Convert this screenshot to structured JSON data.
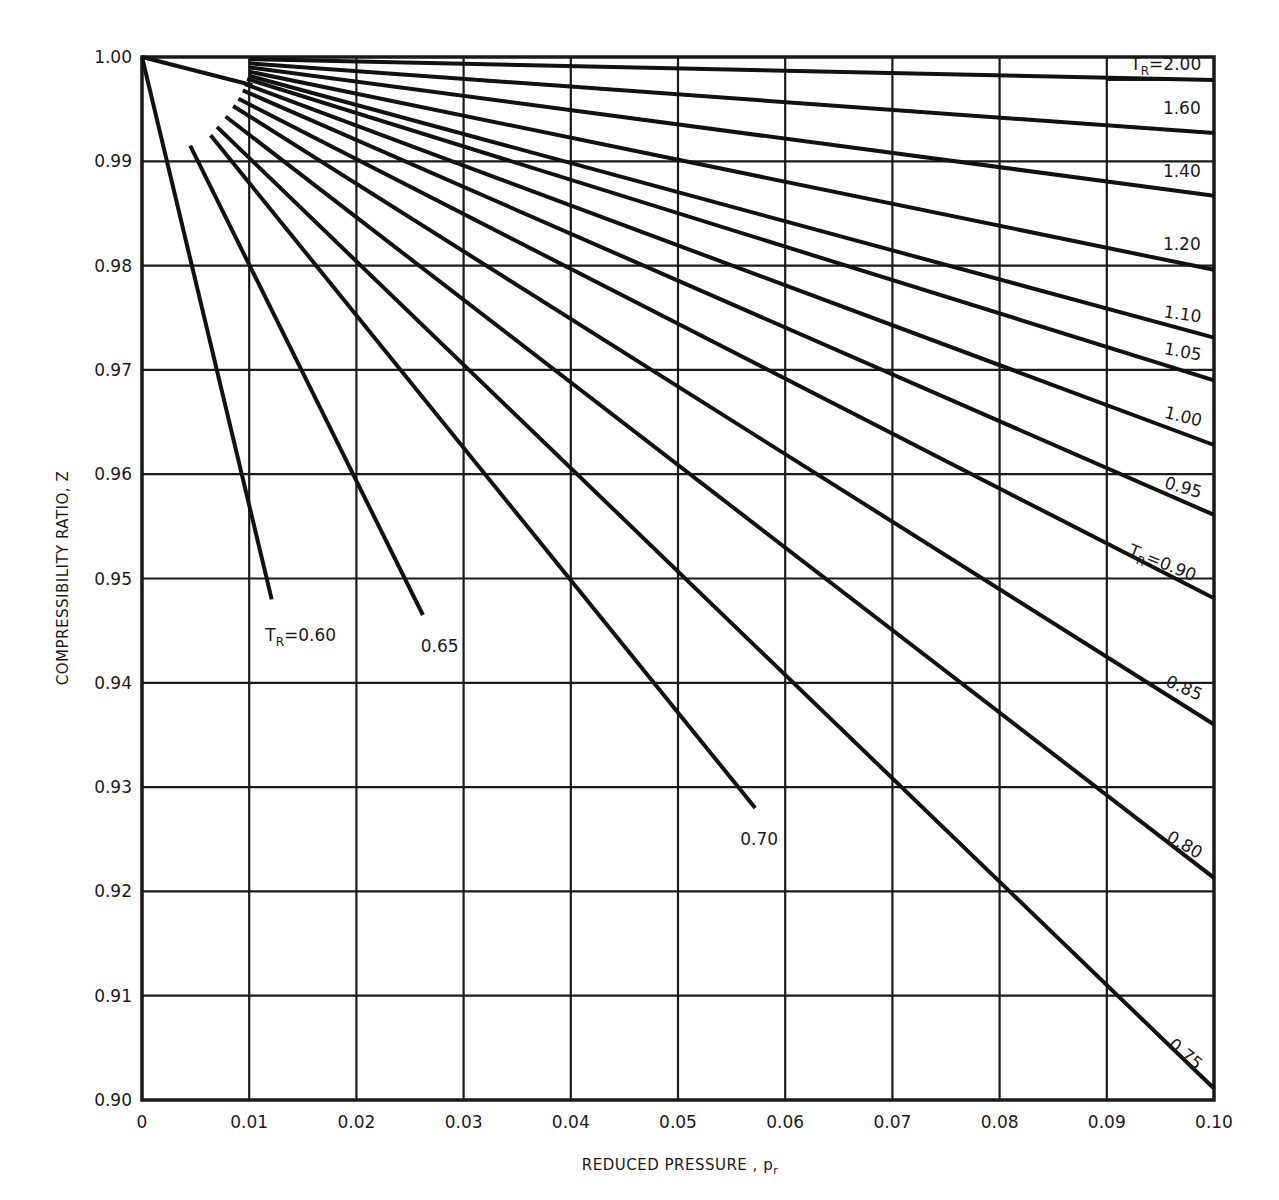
{
  "chart_data": {
    "type": "line",
    "title": "",
    "xlabel": "REDUCED PRESSURE , p",
    "xlabel_sub": "r",
    "ylabel": "COMPRESSIBILITY RATIO, Z",
    "xlim": [
      0,
      0.1
    ],
    "ylim": [
      0.9,
      1.0
    ],
    "grid": true,
    "x_ticks": [
      "0",
      "0.01",
      "0.02",
      "0.03",
      "0.04",
      "0.05",
      "0.06",
      "0.07",
      "0.08",
      "0.09",
      "0.10"
    ],
    "y_ticks": [
      "1.00",
      "0.99",
      "0.98",
      "0.97",
      "0.96",
      "0.95",
      "0.94",
      "0.93",
      "0.92",
      "0.91",
      "0.90"
    ],
    "series": [
      {
        "name": "T_R = 2.00",
        "label": "2.00",
        "prefix": "TR",
        "x": [
          0.01,
          0.1
        ],
        "y": [
          0.9998,
          0.9978
        ]
      },
      {
        "name": "T_R = 1.60",
        "label": "1.60",
        "x": [
          0.01,
          0.1
        ],
        "y": [
          0.9994,
          0.9927
        ]
      },
      {
        "name": "T_R = 1.40",
        "label": "1.40",
        "x": [
          0.01,
          0.1
        ],
        "y": [
          0.999,
          0.9867
        ]
      },
      {
        "name": "T_R = 1.20",
        "label": "1.20",
        "x": [
          0.01,
          0.1
        ],
        "y": [
          0.9986,
          0.9796
        ]
      },
      {
        "name": "T_R = 1.10",
        "label": "1.10",
        "x": [
          0.01,
          0.1
        ],
        "y": [
          0.9982,
          0.9731
        ]
      },
      {
        "name": "T_R = 1.05",
        "label": "1.05",
        "x": [
          0.0098,
          0.1
        ],
        "y": [
          0.9979,
          0.969
        ]
      },
      {
        "name": "T_R = 1.00",
        "label": "1.00",
        "x": [
          0.0096,
          0.1
        ],
        "y": [
          0.9974,
          0.9628
        ]
      },
      {
        "name": "T_R = 0.95",
        "label": "0.95",
        "x": [
          0.0094,
          0.1
        ],
        "y": [
          0.9968,
          0.9561
        ]
      },
      {
        "name": "T_R = 0.90",
        "label": "0.90",
        "prefix": "TR",
        "x": [
          0.009,
          0.1
        ],
        "y": [
          0.996,
          0.9481
        ]
      },
      {
        "name": "T_R = 0.85",
        "label": "0.85",
        "x": [
          0.0085,
          0.1
        ],
        "y": [
          0.9953,
          0.936
        ]
      },
      {
        "name": "T_R = 0.80",
        "label": "0.80",
        "x": [
          0.0078,
          0.1
        ],
        "y": [
          0.9943,
          0.9213
        ]
      },
      {
        "name": "T_R = 0.75",
        "label": "0.75",
        "x": [
          0.007,
          0.1
        ],
        "y": [
          0.9933,
          0.9011
        ]
      },
      {
        "name": "T_R = 0.70",
        "label": "0.70",
        "x": [
          0.0064,
          0.0572
        ],
        "y": [
          0.9925,
          0.928
        ]
      },
      {
        "name": "T_R = 0.65",
        "label": "0.65",
        "x": [
          0.0045,
          0.0262
        ],
        "y": [
          0.9915,
          0.9465
        ]
      },
      {
        "name": "T_R = 0.60",
        "label": "0.60",
        "prefix": "TR",
        "x": [
          0.0,
          0.0121
        ],
        "y": [
          1.0,
          0.948
        ]
      },
      {
        "name": "T_R = 0.60 companion (from origin)",
        "label": "",
        "x": [
          0.0,
          0.0103
        ],
        "y": [
          1.0,
          0.9973
        ]
      }
    ],
    "annotations": [
      {
        "text": "TR=2.00",
        "x": 0.0955,
        "y": 0.9988
      },
      {
        "text": "1.60",
        "x": 0.097,
        "y": 0.9945
      },
      {
        "text": "1.40",
        "x": 0.097,
        "y": 0.9885
      },
      {
        "text": "1.20",
        "x": 0.097,
        "y": 0.9815
      },
      {
        "text": "1.10",
        "x": 0.097,
        "y": 0.9748
      },
      {
        "text": "1.05",
        "x": 0.097,
        "y": 0.9712
      },
      {
        "text": "1.00",
        "x": 0.097,
        "y": 0.965
      },
      {
        "text": "0.95",
        "x": 0.097,
        "y": 0.9582
      },
      {
        "text": "TR = 0.90",
        "x": 0.095,
        "y": 0.951
      },
      {
        "text": "0.85",
        "x": 0.097,
        "y": 0.939
      },
      {
        "text": "0.80",
        "x": 0.097,
        "y": 0.924
      },
      {
        "text": "0.75",
        "x": 0.097,
        "y": 0.904
      },
      {
        "text": "0.70",
        "x": 0.0558,
        "y": 0.9245
      },
      {
        "text": "0.65",
        "x": 0.026,
        "y": 0.943
      },
      {
        "text": "TR = 0.60",
        "x": 0.0115,
        "y": 0.944
      }
    ]
  }
}
